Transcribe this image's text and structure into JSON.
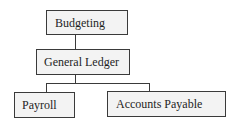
{
  "diagram": {
    "type": "hierarchy",
    "nodes": [
      {
        "id": "budgeting",
        "label": "Budgeting"
      },
      {
        "id": "general_ledger",
        "label": "General Ledger"
      },
      {
        "id": "payroll",
        "label": "Payroll"
      },
      {
        "id": "accounts_payable",
        "label": "Accounts Payable"
      }
    ],
    "edges": [
      {
        "from": "budgeting",
        "to": "general_ledger"
      },
      {
        "from": "general_ledger",
        "to": "payroll"
      },
      {
        "from": "general_ledger",
        "to": "accounts_payable"
      }
    ]
  }
}
